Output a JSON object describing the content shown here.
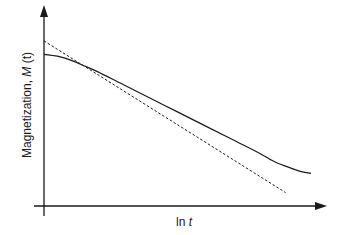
{
  "chart_data": {
    "type": "line",
    "title": "",
    "xlabel": "ln t",
    "ylabel": "Magnetization, M (t)",
    "xlabel_parts": {
      "text": "ln ",
      "italic": "t"
    },
    "ylabel_parts": {
      "text": "Magnetization, ",
      "italic": "M",
      "rest": " (t)"
    },
    "xlim": [
      0,
      1
    ],
    "ylim": [
      0,
      1
    ],
    "grid": false,
    "legend": "none",
    "series": [
      {
        "name": "Magnetization M(t)",
        "style": "solid",
        "x": [
          0.0,
          0.05,
          0.1,
          0.15,
          0.2,
          0.3,
          0.4,
          0.5,
          0.6,
          0.7,
          0.8,
          0.85,
          0.88,
          0.92,
          0.96,
          1.0
        ],
        "y": [
          0.79,
          0.78,
          0.76,
          0.73,
          0.7,
          0.63,
          0.56,
          0.49,
          0.42,
          0.35,
          0.28,
          0.24,
          0.22,
          0.2,
          0.18,
          0.17
        ]
      },
      {
        "name": "Linear fit",
        "style": "dashed",
        "x": [
          0.0,
          0.905
        ],
        "y": [
          0.86,
          0.07
        ]
      }
    ]
  }
}
